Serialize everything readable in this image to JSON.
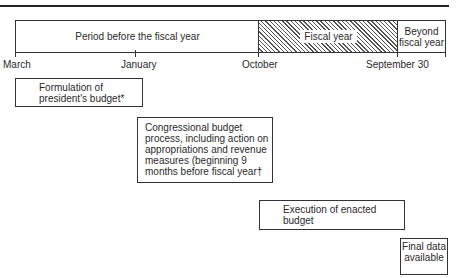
{
  "timeline": {
    "segments": [
      {
        "id": "before",
        "label": "Period before the fiscal year"
      },
      {
        "id": "fiscal",
        "label": "Fiscal year"
      },
      {
        "id": "beyond",
        "label": "Beyond fiscal year"
      }
    ],
    "ticks": [
      {
        "label": "March"
      },
      {
        "label": "January"
      },
      {
        "label": "October"
      },
      {
        "label": "September 30"
      }
    ]
  },
  "boxes": {
    "formulation": "Formulation of president's budget*",
    "congressional": "Congressional budget process, including action on appropriations and revenue measures (beginning 9 months before fiscal year†",
    "execution": "Execution of enacted budget",
    "final": "Final data available"
  }
}
